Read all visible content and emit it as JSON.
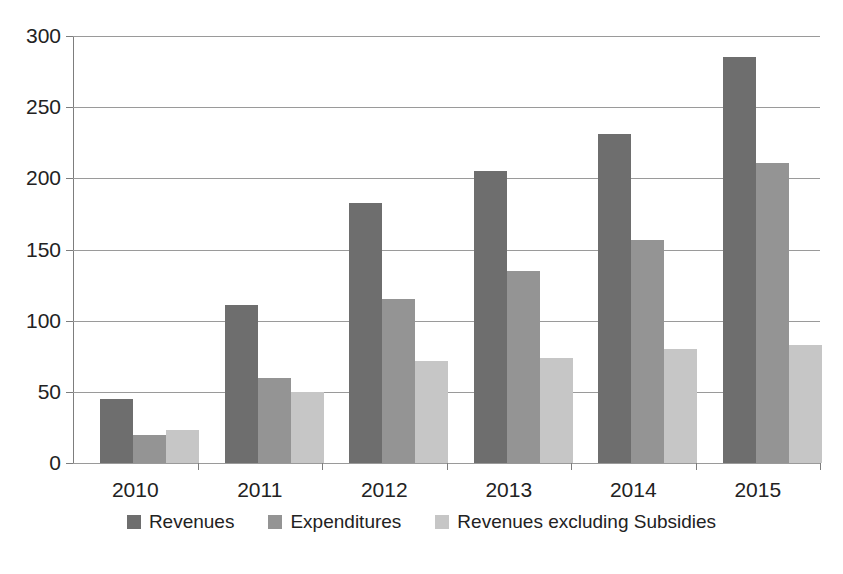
{
  "chart_data": {
    "type": "bar",
    "title": "",
    "subtitle": "",
    "xlabel": "",
    "ylabel": "",
    "categories": [
      "2010",
      "2011",
      "2012",
      "2013",
      "2014",
      "2015"
    ],
    "series": [
      {
        "name": "Revenues",
        "color": "#6e6e6e",
        "values": [
          45,
          111,
          183,
          205,
          231,
          285
        ]
      },
      {
        "name": "Expenditures",
        "color": "#949494",
        "values": [
          20,
          60,
          115,
          135,
          157,
          211
        ]
      },
      {
        "name": "Revenues excluding Subsidies",
        "color": "#c6c6c6",
        "values": [
          23,
          50,
          72,
          74,
          80,
          83
        ]
      }
    ],
    "ylim": [
      0,
      300
    ],
    "yticks": [
      0,
      50,
      100,
      150,
      200,
      250,
      300
    ],
    "ytick_labels": [
      "0",
      "50",
      "100",
      "150",
      "200",
      "250",
      "300"
    ],
    "grid": true,
    "grid_axis": "y",
    "legend_position": "bottom",
    "annotations": []
  },
  "legend": {
    "items": [
      {
        "label": "Revenues"
      },
      {
        "label": "Expenditures"
      },
      {
        "label": "Revenues excluding Subsidies"
      }
    ]
  }
}
